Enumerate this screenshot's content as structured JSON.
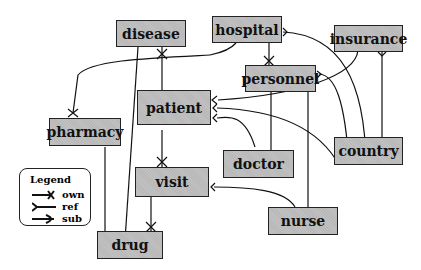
{
  "diagram": {
    "type": "entity-relationship",
    "entities": {
      "disease": "disease",
      "hospital": "hospital",
      "insurance": "insurance",
      "personnel": "personnel",
      "patient": "patient",
      "pharmacy": "pharmacy",
      "doctor": "doctor",
      "country": "country",
      "visit": "visit",
      "nurse": "nurse",
      "drug": "drug"
    },
    "relations": [
      {
        "from": "disease",
        "to": "pharmacy",
        "type": "own"
      },
      {
        "from": "disease",
        "to": "patient",
        "type": "own"
      },
      {
        "from": "disease",
        "to": "drug",
        "type": "ref"
      },
      {
        "from": "hospital",
        "to": "personnel",
        "type": "own"
      },
      {
        "from": "hospital",
        "to": "country",
        "type": "ref"
      },
      {
        "from": "insurance",
        "to": "patient",
        "type": "ref"
      },
      {
        "from": "insurance",
        "to": "country",
        "type": "ref"
      },
      {
        "from": "personnel",
        "to": "doctor",
        "type": "sub"
      },
      {
        "from": "personnel",
        "to": "nurse",
        "type": "sub"
      },
      {
        "from": "personnel",
        "to": "country",
        "type": "ref"
      },
      {
        "from": "patient",
        "to": "visit",
        "type": "own"
      },
      {
        "from": "patient",
        "to": "doctor",
        "type": "ref"
      },
      {
        "from": "patient",
        "to": "country",
        "type": "ref"
      },
      {
        "from": "pharmacy",
        "to": "drug",
        "type": "ref"
      },
      {
        "from": "visit",
        "to": "drug",
        "type": "own"
      },
      {
        "from": "nurse",
        "to": "visit",
        "type": "ref"
      }
    ],
    "legend": {
      "title": "Legend",
      "items": [
        "own",
        "ref",
        "sub"
      ]
    }
  }
}
